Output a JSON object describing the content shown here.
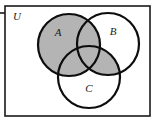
{
  "figure": {
    "type": "venn-diagram",
    "set_count": 3,
    "universe": {
      "label": "U",
      "label_x": 17,
      "label_y": 17,
      "rect": {
        "x": 5,
        "y": 6,
        "width": 145,
        "height": 110
      }
    },
    "tick": {
      "x": 0,
      "y": 13,
      "length": 5
    },
    "circles": [
      {
        "name": "A",
        "label": "A",
        "cx": 69,
        "cy": 45,
        "r": 31,
        "label_x": 58,
        "label_y": 33,
        "shaded": true
      },
      {
        "name": "B",
        "label": "B",
        "cx": 108,
        "cy": 44,
        "r": 31,
        "label_x": 113,
        "label_y": 32,
        "shaded": false
      },
      {
        "name": "C",
        "label": "C",
        "cx": 89,
        "cy": 77,
        "r": 31,
        "label_x": 89,
        "label_y": 89,
        "shaded": false
      }
    ],
    "shaded_regions": [
      "A",
      "B-and-C"
    ],
    "colors": {
      "shade_fill": "#b4b4b4",
      "circle_stroke": "#0d0d0d",
      "frame_stroke": "#1a1a1a",
      "background": "#ffffff",
      "label_color": "#1a1a1a"
    },
    "strokes": {
      "circle_width": 2.2,
      "frame_width": 1.6,
      "tick_width": 1.6
    }
  }
}
